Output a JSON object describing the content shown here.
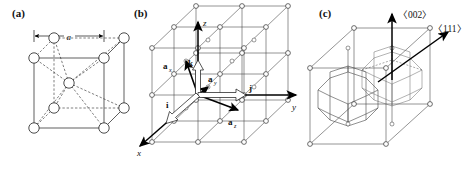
{
  "figure": {
    "type": "crystallography-diagram",
    "background_color": "#ffffff",
    "line_color": "#1a1a1a"
  },
  "panels": [
    {
      "id": "a",
      "label": "(a)",
      "caption_text": "(a)",
      "description": "Conventional bcc cubic unit cell with corner atoms and one body-centre atom",
      "dimension_label": "a",
      "atom_count_corners": 8,
      "atom_count_center": 1
    },
    {
      "id": "b",
      "label": "(b)",
      "caption_text": "(b)",
      "description": "2x2x2 bcc lattice showing primitive translation vectors and Cartesian unit vectors",
      "axes": [
        {
          "name": "z",
          "label": "z",
          "direction": "up"
        },
        {
          "name": "y",
          "label": "y",
          "direction": "right"
        },
        {
          "name": "x",
          "label": "x",
          "direction": "down-left"
        }
      ],
      "primitive_vectors": [
        {
          "name": "a_x",
          "base": "a",
          "subscript": "x"
        },
        {
          "name": "a_y",
          "base": "a",
          "subscript": "y"
        },
        {
          "name": "a_z",
          "base": "a",
          "subscript": "z"
        }
      ],
      "unit_vectors": [
        {
          "name": "i",
          "label": "i"
        },
        {
          "name": "j",
          "label": "j"
        },
        {
          "name": "k",
          "label": "k"
        }
      ]
    },
    {
      "id": "c",
      "label": "(c)",
      "caption_text": "(c)",
      "description": "Wigner-Seitz cells (truncated octahedra) of the bcc lattice inside the cubic frame",
      "directions": [
        {
          "name": "002",
          "label": "〈002〉",
          "arrow": "up"
        },
        {
          "name": "111",
          "label": "〈111〉",
          "arrow": "up-right"
        }
      ]
    }
  ],
  "labels": {
    "panel_a": "(a)",
    "panel_b": "(b)",
    "panel_c": "(c)",
    "lattice_param": "a",
    "axis_z": "z",
    "axis_y": "y",
    "axis_x": "x",
    "vec_a_base": "a",
    "sub_x": "x",
    "sub_y": "y",
    "sub_z": "z",
    "unit_i": "i",
    "unit_j": "j",
    "unit_k": "k",
    "dir_002": "〈002〉",
    "dir_111": "〈111〉"
  }
}
